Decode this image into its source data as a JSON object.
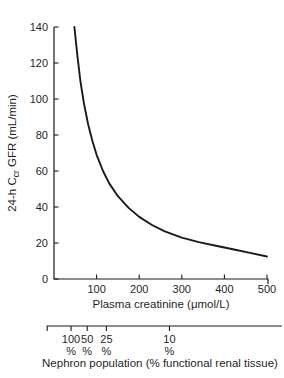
{
  "figure": {
    "background": "#ffffff",
    "text_color": "#1f1f1f",
    "line_color": "#1a1a1a"
  },
  "chart_data": {
    "type": "line",
    "title": "",
    "xlabel": "Plasma creatinine (μmol/L)",
    "ylabel": "24-h Ccr GFR (mL/min)",
    "ylabel_parts": {
      "prefix": "24-h C",
      "subscript": "cr",
      "suffix": " GFR (mL/min)"
    },
    "xlim": [
      0,
      500
    ],
    "ylim": [
      0,
      140
    ],
    "x_ticks": [
      100,
      200,
      300,
      400,
      500
    ],
    "y_ticks": [
      0,
      20,
      40,
      60,
      80,
      100,
      120,
      140
    ],
    "grid": false,
    "legend": false,
    "series": [
      {
        "name": "24-h creatinine clearance GFR vs plasma creatinine",
        "x": [
          48,
          55,
          62,
          70,
          80,
          90,
          100,
          115,
          130,
          150,
          175,
          200,
          230,
          260,
          300,
          340,
          380,
          420,
          460,
          500
        ],
        "y": [
          140,
          124,
          110,
          98,
          86,
          77,
          69,
          60,
          53,
          46,
          39.5,
          34.5,
          30,
          26.5,
          23,
          20.5,
          18.5,
          16.5,
          14.5,
          12.5
        ]
      }
    ],
    "secondary_x_axis": {
      "label": "Nephron population (% functional renal tissue)",
      "tick_values": [
        "100",
        "50",
        "25",
        "10"
      ],
      "tick_unit": "%",
      "tick_positions_creatinine": [
        40,
        78,
        123,
        271
      ],
      "range_creatinine": [
        -16,
        535
      ]
    }
  }
}
